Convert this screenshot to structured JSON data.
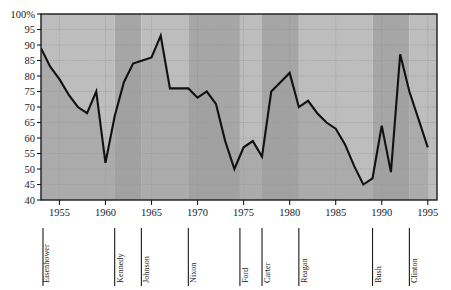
{
  "chart_data": {
    "type": "line",
    "title": "",
    "subtitle": "",
    "xlabel": "",
    "ylabel": "",
    "xlim": [
      1953,
      1996
    ],
    "ylim": [
      40,
      100
    ],
    "ytick_labels": [
      "100%",
      "95",
      "90",
      "85",
      "80",
      "75",
      "70",
      "65",
      "60",
      "55",
      "50",
      "45",
      "40"
    ],
    "ytick_values": [
      100,
      95,
      90,
      85,
      80,
      75,
      70,
      65,
      60,
      55,
      50,
      45,
      40
    ],
    "xtick_labels": [
      "1955",
      "1960",
      "1965",
      "1970",
      "1975",
      "1980",
      "1985",
      "1990",
      "1995"
    ],
    "xtick_values": [
      1955,
      1960,
      1965,
      1970,
      1975,
      1980,
      1985,
      1990,
      1995
    ],
    "grid": true,
    "legend": "none",
    "series": [
      {
        "name": "Approval",
        "x": [
          1953,
          1954,
          1955,
          1956,
          1957,
          1958,
          1959,
          1960,
          1961,
          1962,
          1963,
          1964,
          1965,
          1966,
          1967,
          1968,
          1969,
          1970,
          1971,
          1972,
          1973,
          1974,
          1975,
          1976,
          1977,
          1978,
          1979,
          1980,
          1981,
          1982,
          1983,
          1984,
          1985,
          1986,
          1987,
          1988,
          1989,
          1990,
          1991,
          1992,
          1993,
          1994,
          1995
        ],
        "values": [
          89,
          83,
          79,
          74,
          70,
          68,
          75,
          52,
          67,
          78,
          84,
          85,
          86,
          93,
          76,
          76,
          76,
          73,
          75,
          71,
          59,
          50,
          57,
          59,
          54,
          75,
          78,
          81,
          70,
          72,
          68,
          65,
          63,
          58,
          51,
          45,
          47,
          64,
          49,
          87,
          75,
          66,
          57
        ]
      }
    ],
    "bands": [
      {
        "label": "Eisenhower",
        "start": 1953,
        "end": 1961,
        "shade": "light"
      },
      {
        "label": "Kennedy",
        "start": 1961,
        "end": 1963.9,
        "shade": "dark"
      },
      {
        "label": "Johnson",
        "start": 1963.9,
        "end": 1969,
        "shade": "light"
      },
      {
        "label": "Nixon",
        "start": 1969,
        "end": 1974.6,
        "shade": "dark"
      },
      {
        "label": "Ford",
        "start": 1974.6,
        "end": 1977,
        "shade": "light"
      },
      {
        "label": "Carter",
        "start": 1977,
        "end": 1981,
        "shade": "dark"
      },
      {
        "label": "Reagan",
        "start": 1981,
        "end": 1989,
        "shade": "light"
      },
      {
        "label": "Bush",
        "start": 1989,
        "end": 1993,
        "shade": "dark"
      },
      {
        "label": "Clinton",
        "start": 1993,
        "end": 1996,
        "shade": "light"
      }
    ]
  },
  "colors": {
    "plot_background_light": "#bdbdbd",
    "plot_background_dark": "#a6a6a6",
    "area_fill": "#9c9c9c",
    "line": "#111111",
    "grid": "#8d8d8d",
    "axis": "#1a1a1a",
    "text": "#1a1a1a",
    "page_background": "#ffffff"
  }
}
